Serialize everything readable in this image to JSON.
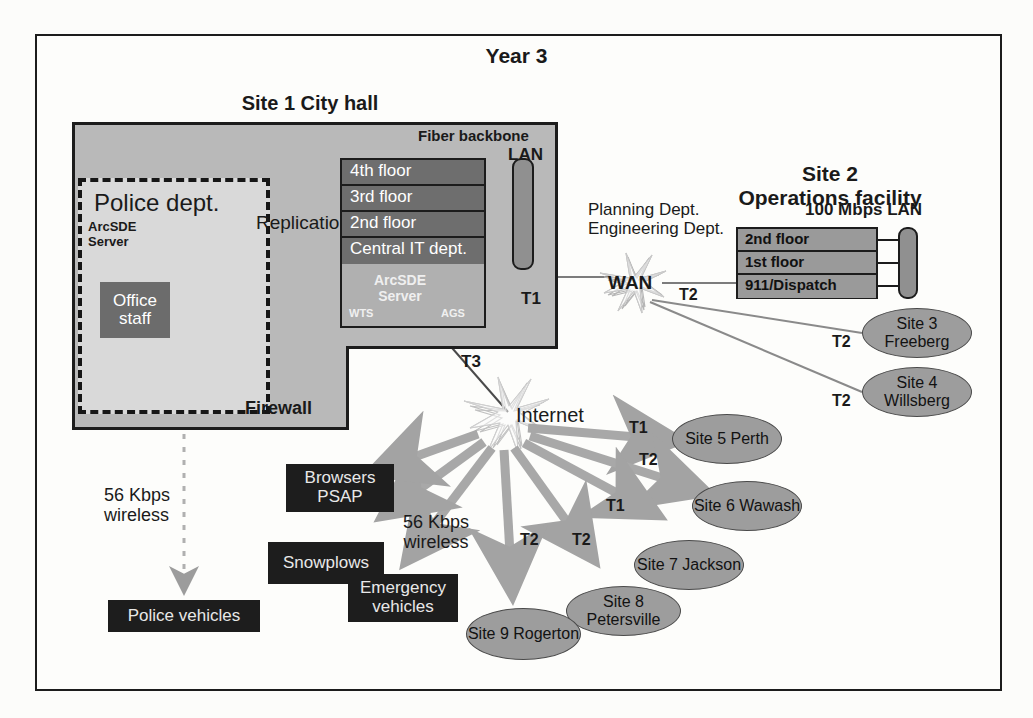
{
  "title": "Year 3",
  "sites": {
    "site1": {
      "label": "Site 1 City hall",
      "fiber_backbone": "Fiber backbone",
      "lan": "LAN",
      "floors": [
        "4th floor",
        "3rd floor",
        "2nd floor",
        "Central IT dept."
      ],
      "arcsde_server": "ArcSDE\nServer",
      "wts": "WTS",
      "ags": "AGS",
      "t1": "T1",
      "t3": "T3"
    },
    "police": {
      "label": "Police dept.",
      "arcsde_server": "ArcSDE\nServer",
      "office_staff": "Office\nstaff",
      "firewall": "Firewall",
      "replication": "Replication"
    },
    "site2": {
      "label": "Site 2\nOperations facility",
      "lan": "100 Mbps LAN",
      "floors": [
        "2nd floor",
        "1st floor",
        "911/Dispatch"
      ],
      "depts": "Planning Dept.\nEngineering Dept.",
      "wan": "WAN",
      "t2": "T2"
    },
    "remote": [
      {
        "name": "Site 3\nFreeberg",
        "link": "T2"
      },
      {
        "name": "Site 4\nWillsberg",
        "link": "T2"
      },
      {
        "name": "Site 5\nPerth",
        "link": "T1"
      },
      {
        "name": "Site 6\nWawash",
        "link": "T2"
      },
      {
        "name": "Site 7\nJackson",
        "link": "T1"
      },
      {
        "name": "Site 8\nPetersville",
        "link": "T2"
      },
      {
        "name": "Site 9\nRogerton",
        "link": "T2"
      }
    ]
  },
  "internet": {
    "label": "Internet"
  },
  "mobile": {
    "browsers_psap": "Browsers\nPSAP",
    "snowplows": "Snowplows",
    "emergency_vehicles": "Emergency\nvehicles",
    "police_vehicles": "Police vehicles",
    "wireless_left": "56 Kbps\nwireless",
    "wireless_right": "56 Kbps\nwireless"
  },
  "colors": {
    "frame": "#1c1c1c",
    "site_gray": "#b9b9b9",
    "police_gray": "#d9d9d9",
    "floor_dark": "#6e6e6e",
    "black_box": "#1d1d1d",
    "ellipse": "#9d9d9d",
    "arrow_gray": "#a8a8a8"
  }
}
